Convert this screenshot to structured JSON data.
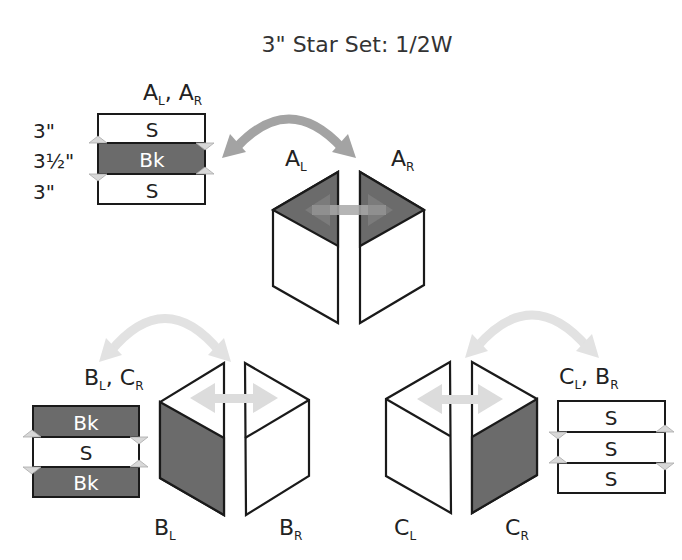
{
  "title": "3\" Star Set: 1/2W",
  "colors": {
    "dark_fabric": "#6b6b6b",
    "light_fabric": "#ffffff",
    "outline": "#1a1a1a",
    "arc_dark": "#a3a3a3",
    "arc_light": "#e2e2e2",
    "notch": "#d8d8d8"
  },
  "strip_sets": {
    "a": {
      "label_main1": "A",
      "label_sub1": "L",
      "label_sep": ", ",
      "label_main2": "A",
      "label_sub2": "R",
      "rows": [
        {
          "fabric": "S",
          "size": "3\""
        },
        {
          "fabric": "Bk",
          "size": "3½\""
        },
        {
          "fabric": "S",
          "size": "3\""
        }
      ]
    },
    "b": {
      "label_main1": "B",
      "label_sub1": "L",
      "label_sep": ", ",
      "label_main2": "C",
      "label_sub2": "R",
      "rows": [
        {
          "fabric": "Bk"
        },
        {
          "fabric": "S"
        },
        {
          "fabric": "Bk"
        }
      ]
    },
    "c": {
      "label_main1": "C",
      "label_sub1": "L",
      "label_sep": ", ",
      "label_main2": "B",
      "label_sub2": "R",
      "rows": [
        {
          "fabric": "S"
        },
        {
          "fabric": "S"
        },
        {
          "fabric": "S"
        }
      ]
    }
  },
  "pieces": {
    "a_left": {
      "main": "A",
      "sub": "L"
    },
    "a_right": {
      "main": "A",
      "sub": "R"
    },
    "b_left": {
      "main": "B",
      "sub": "L"
    },
    "b_right": {
      "main": "B",
      "sub": "R"
    },
    "c_left": {
      "main": "C",
      "sub": "L"
    },
    "c_right": {
      "main": "C",
      "sub": "R"
    }
  }
}
